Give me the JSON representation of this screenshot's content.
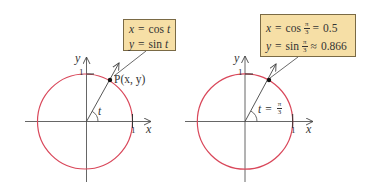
{
  "colors": {
    "circle": "#d9475a",
    "axis": "#444444",
    "box_fill": "#f6dfa6",
    "box_border": "#7a6a45",
    "text": "#333333"
  },
  "left_panel": {
    "box": {
      "line1": {
        "lhs": "x",
        "eq": "=",
        "rhs": "cos",
        "var": "t"
      },
      "line2": {
        "lhs": "y",
        "eq": "=",
        "rhs": "sin",
        "var": "t"
      }
    },
    "point_label": "P(x, y)",
    "angle_label": "t",
    "axis_x_label": "x",
    "axis_y_label": "y",
    "tick_x": "1",
    "tick_y": "1"
  },
  "right_panel": {
    "box": {
      "line1": {
        "lhs": "x",
        "eq": "=",
        "rhs": "cos",
        "frac_num": "π",
        "frac_den": "3",
        "rel": "=",
        "value": "0.5"
      },
      "line2": {
        "lhs": "y",
        "eq": "=",
        "rhs": "sin",
        "frac_num": "π",
        "frac_den": "3",
        "rel": "≈",
        "value": "0.866"
      }
    },
    "angle_label": {
      "var": "t",
      "eq": "=",
      "frac_num": "π",
      "frac_den": "3"
    },
    "axis_x_label": "x",
    "axis_y_label": "y",
    "tick_x": "1",
    "tick_y": "1"
  }
}
